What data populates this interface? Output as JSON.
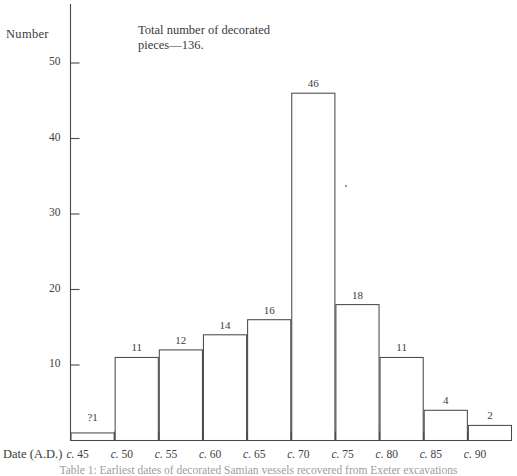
{
  "figure": {
    "y_axis_title": "Number",
    "x_axis_title": "Date (A.D.)",
    "annotation_line1": "Total number of decorated",
    "annotation_line2": "pieces—136.",
    "caption": "Table 1: Earliest dates of decorated Samian vessels recovered from Exeter excavations",
    "ink_color": "#3a3a3a",
    "background_color": "#ffffff"
  },
  "chart_data": {
    "type": "bar",
    "title": "",
    "subtitle": "Total number of decorated pieces—136.",
    "xlabel": "Date (A.D.)",
    "ylabel": "Number",
    "categories": [
      "c. 45",
      "c. 50",
      "c. 55",
      "c. 60",
      "c. 65",
      "c. 70",
      "c. 75",
      "c. 80",
      "c. 85",
      "c. 90"
    ],
    "values": [
      1,
      11,
      12,
      14,
      16,
      46,
      18,
      11,
      4,
      2
    ],
    "value_labels": [
      "?1",
      "11",
      "12",
      "14",
      "16",
      "46",
      "18",
      "11",
      "4",
      "2"
    ],
    "total": 136,
    "ylim": [
      0,
      52
    ],
    "yticks": [
      10,
      20,
      30,
      40,
      50
    ],
    "ytick_labels": [
      "10",
      "20",
      "30",
      "40",
      "50"
    ],
    "grid": false,
    "legend": false,
    "bar_style": "outline"
  }
}
